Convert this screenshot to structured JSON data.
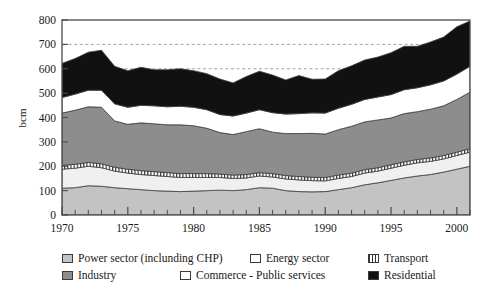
{
  "chart_data": {
    "type": "area",
    "stacked": true,
    "title": "",
    "subtitle": "",
    "xlabel": "",
    "ylabel": "bcm",
    "xlim": [
      1970,
      2001
    ],
    "ylim": [
      0,
      800
    ],
    "ytick_labels": [
      "0",
      "100",
      "200",
      "300",
      "400",
      "500",
      "600",
      "700",
      "800"
    ],
    "yticks": [
      0,
      100,
      200,
      300,
      400,
      500,
      600,
      700,
      800
    ],
    "xtick_labels": [
      "1970",
      "1975",
      "1980",
      "1985",
      "1990",
      "1995",
      "2000"
    ],
    "xticks": [
      1970,
      1975,
      1980,
      1985,
      1990,
      1995,
      2000
    ],
    "minor_xticks_every": 1,
    "gridlines": [
      600,
      700
    ],
    "gridline_style": "dashed",
    "legend_position": "below",
    "x": [
      1970,
      1971,
      1972,
      1973,
      1974,
      1975,
      1976,
      1977,
      1978,
      1979,
      1980,
      1981,
      1982,
      1983,
      1984,
      1985,
      1986,
      1987,
      1988,
      1989,
      1990,
      1991,
      1992,
      1993,
      1994,
      1995,
      1996,
      1997,
      1998,
      1999,
      2000,
      2001
    ],
    "series": [
      {
        "name": "Power sector (inclunding CHP)",
        "color": "#c3c3c3",
        "values": [
          110,
          112,
          120,
          118,
          112,
          108,
          104,
          100,
          98,
          96,
          98,
          100,
          102,
          100,
          104,
          112,
          110,
          100,
          96,
          95,
          96,
          104,
          112,
          124,
          132,
          142,
          152,
          160,
          166,
          176,
          188,
          200
        ]
      },
      {
        "name": "Commerce - Public services",
        "color": "#f0f0f0",
        "values": [
          78,
          80,
          80,
          76,
          68,
          64,
          62,
          62,
          60,
          58,
          56,
          54,
          52,
          50,
          48,
          48,
          46,
          48,
          48,
          46,
          44,
          46,
          46,
          48,
          48,
          50,
          52,
          54,
          54,
          54,
          56,
          58
        ]
      },
      {
        "name": "Transport",
        "color": "#ffffff",
        "hatch": "vertical-bars",
        "values": [
          16,
          16,
          16,
          16,
          16,
          16,
          16,
          16,
          16,
          16,
          16,
          16,
          14,
          14,
          14,
          14,
          14,
          14,
          14,
          14,
          14,
          14,
          14,
          14,
          14,
          14,
          14,
          14,
          14,
          14,
          14,
          14
        ]
      },
      {
        "name": "Industry",
        "color": "#8d8d8d",
        "values": [
          214,
          222,
          228,
          232,
          190,
          184,
          196,
          196,
          196,
          200,
          196,
          186,
          170,
          166,
          176,
          180,
          170,
          172,
          176,
          180,
          178,
          186,
          192,
          196,
          196,
          192,
          198,
          196,
          200,
          204,
          216,
          232
        ]
      },
      {
        "name": "Energy sector",
        "color": "#ffffff",
        "values": [
          64,
          66,
          68,
          70,
          70,
          70,
          72,
          74,
          74,
          76,
          76,
          76,
          74,
          76,
          76,
          78,
          80,
          80,
          82,
          84,
          86,
          88,
          90,
          92,
          94,
          96,
          98,
          98,
          100,
          102,
          104,
          106
        ]
      },
      {
        "name": "Residential",
        "color": "#111111",
        "values": [
          140,
          146,
          156,
          164,
          154,
          150,
          156,
          148,
          152,
          154,
          150,
          148,
          146,
          136,
          150,
          158,
          154,
          140,
          156,
          138,
          140,
          154,
          158,
          162,
          164,
          172,
          178,
          170,
          176,
          180,
          194,
          186
        ]
      }
    ],
    "totals": [
      622,
      642,
      668,
      676,
      610,
      592,
      606,
      596,
      596,
      600,
      592,
      580,
      558,
      542,
      568,
      590,
      574,
      554,
      572,
      557,
      558,
      592,
      612,
      636,
      648,
      666,
      692,
      692,
      710,
      730,
      772,
      796
    ]
  },
  "legend": {
    "items": [
      {
        "label": "Power sector (inclunding CHP)",
        "swatch": "power-swatch"
      },
      {
        "label": "Energy sector",
        "swatch": "energy-swatch"
      },
      {
        "label": "Transport",
        "swatch": "transport-swatch"
      },
      {
        "label": "Industry",
        "swatch": "industry-swatch"
      },
      {
        "label": "Commerce - Public services",
        "swatch": "commerce-swatch"
      },
      {
        "label": "Residential",
        "swatch": "residential-swatch"
      }
    ]
  },
  "axis": {
    "y_title": "bcm"
  }
}
